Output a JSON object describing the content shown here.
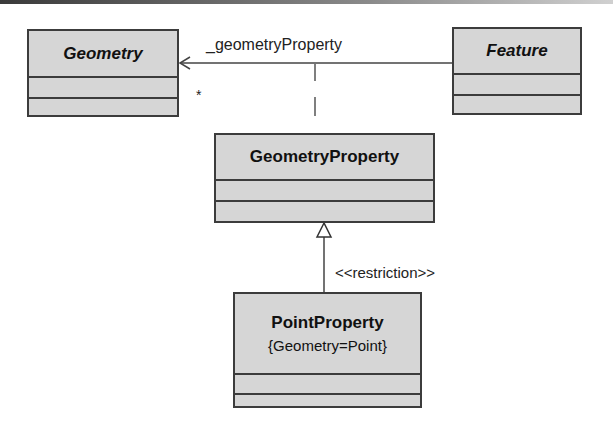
{
  "diagram": {
    "type": "UML class diagram",
    "classes": {
      "geometry": {
        "name": "Geometry",
        "abstract": true
      },
      "feature": {
        "name": "Feature",
        "abstract": true
      },
      "geometry_property": {
        "name": "GeometryProperty",
        "abstract": false
      },
      "point_property": {
        "name": "PointProperty",
        "constraint": "{Geometry=Point}",
        "abstract": false
      }
    },
    "association": {
      "role": "_geometryProperty",
      "multiplicity": "*",
      "from": "Feature",
      "to": "Geometry"
    },
    "generalization": {
      "stereotype": "<<restriction>>",
      "from": "PointProperty",
      "to": "GeometryProperty"
    },
    "colors": {
      "class_fill": "#d6d6d6",
      "class_border": "#3c3c3c",
      "line": "#444444"
    }
  }
}
